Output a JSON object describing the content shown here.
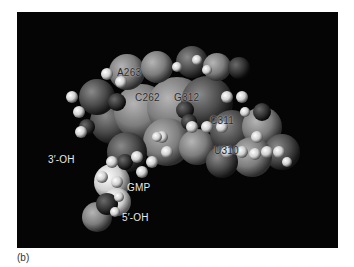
{
  "figure": {
    "panel_label": "(b)",
    "labels": {
      "a263": "A263",
      "c262": "C262",
      "g312": "G312",
      "c311": "C311",
      "u310": "U310",
      "oh3": "3′-OH",
      "gmp": "GMP",
      "oh5": "5′-OH"
    },
    "colors": {
      "background": "#050505",
      "label_light": "#e8e8e8",
      "label_dark": "#2a2a2a"
    }
  }
}
